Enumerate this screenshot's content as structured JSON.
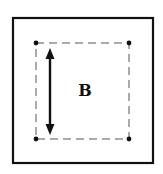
{
  "diagram": {
    "label": "B",
    "outer_box": {
      "x": 13,
      "y": 18,
      "width": 140,
      "height": 145,
      "stroke": "#111111",
      "stroke_width": 2.2
    },
    "inner_box": {
      "x": 36,
      "y": 43,
      "width": 93,
      "height": 96,
      "stroke": "#555555",
      "dash": "8,5"
    },
    "corner_points": [
      {
        "name": "top-left",
        "x": 36,
        "y": 43
      },
      {
        "name": "top-right",
        "x": 129,
        "y": 43
      },
      {
        "name": "bottom-left",
        "x": 36,
        "y": 139
      },
      {
        "name": "bottom-right",
        "x": 129,
        "y": 139
      }
    ],
    "arrow": {
      "x": 50,
      "y1": 49,
      "y2": 134,
      "direction": "double-headed-vertical"
    },
    "colors": {
      "line": "#111111",
      "dash": "#555555",
      "background": "#ffffff"
    }
  }
}
